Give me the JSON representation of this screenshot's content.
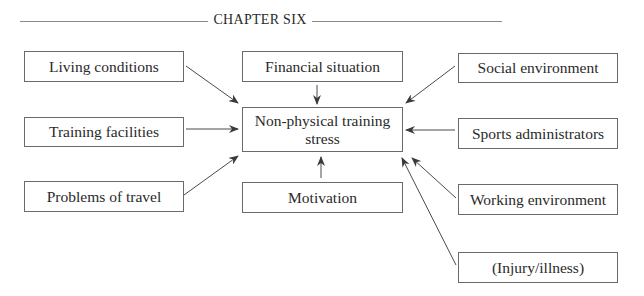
{
  "header": {
    "title": "CHAPTER SIX"
  },
  "diagram": {
    "center": {
      "label": "Non-physical training stress",
      "line1": "Non-physical training",
      "line2": "stress"
    },
    "factors": [
      {
        "id": "living-conditions",
        "label": "Living conditions"
      },
      {
        "id": "financial-situation",
        "label": "Financial situation"
      },
      {
        "id": "social-environment",
        "label": "Social environment"
      },
      {
        "id": "training-facilities",
        "label": "Training facilities"
      },
      {
        "id": "sports-administrators",
        "label": "Sports administrators"
      },
      {
        "id": "problems-of-travel",
        "label": "Problems of travel"
      },
      {
        "id": "motivation",
        "label": "Motivation"
      },
      {
        "id": "working-environment",
        "label": "Working environment"
      },
      {
        "id": "injury-illness",
        "label": "(Injury/illness)"
      }
    ],
    "edges": [
      {
        "from": "living-conditions",
        "to": "center"
      },
      {
        "from": "financial-situation",
        "to": "center"
      },
      {
        "from": "social-environment",
        "to": "center"
      },
      {
        "from": "training-facilities",
        "to": "center"
      },
      {
        "from": "sports-administrators",
        "to": "center"
      },
      {
        "from": "problems-of-travel",
        "to": "center"
      },
      {
        "from": "motivation",
        "to": "center"
      },
      {
        "from": "working-environment",
        "to": "center"
      },
      {
        "from": "injury-illness",
        "to": "center"
      }
    ]
  }
}
